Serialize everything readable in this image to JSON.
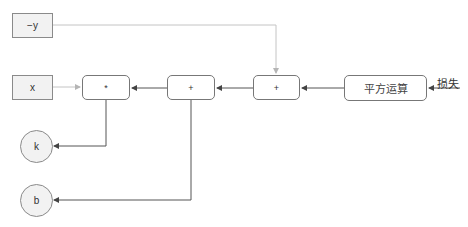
{
  "diagram": {
    "inputs": [
      {
        "id": "neg_y",
        "label": "−y"
      },
      {
        "id": "x",
        "label": "x"
      }
    ],
    "operations": [
      {
        "id": "mul",
        "label": "*"
      },
      {
        "id": "add1",
        "label": "+"
      },
      {
        "id": "add2",
        "label": "+"
      },
      {
        "id": "square",
        "label": "平方运算"
      }
    ],
    "parameters": [
      {
        "id": "k",
        "label": "k"
      },
      {
        "id": "b",
        "label": "b"
      }
    ],
    "loss_label": "损失",
    "edges": [
      {
        "from": "x",
        "to": "mul",
        "style": "light"
      },
      {
        "from": "neg_y",
        "to": "add2",
        "style": "light"
      },
      {
        "from": "loss",
        "to": "square"
      },
      {
        "from": "square",
        "to": "add2"
      },
      {
        "from": "add2",
        "to": "add1"
      },
      {
        "from": "add1",
        "to": "mul"
      },
      {
        "from": "mul",
        "to": "k"
      },
      {
        "from": "add1",
        "to": "b"
      }
    ],
    "colors": {
      "line_dark": "#555555",
      "line_light": "#bbbbbb",
      "box_fill": "#f2f2f2",
      "border": "#8a8a8a"
    }
  }
}
